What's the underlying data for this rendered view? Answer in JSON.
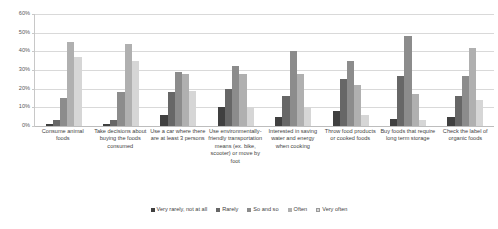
{
  "chart_data": {
    "type": "bar",
    "title": "",
    "xlabel": "",
    "ylabel": "",
    "ylim": [
      0,
      60
    ],
    "y_unit": "%",
    "grid": true,
    "legend_position": "bottom",
    "y_ticks": [
      "0%",
      "10%",
      "20%",
      "30%",
      "40%",
      "50%",
      "60%"
    ],
    "y_tick_values": [
      0,
      10,
      20,
      30,
      40,
      50,
      60
    ],
    "categories": [
      "Consume animal foods",
      "Take decisions about buying the foods consumed",
      "Use a car where there are at least 3 persons",
      "Use environmentally-friendly transportation means (ex. bike, scooter) or move by foot",
      "Interested in saving water and energy when cooking",
      "Throw food products or cooked foods",
      "Buy foods that require long term storage",
      "Check the label of organic foods"
    ],
    "series": [
      {
        "name": "Very rarely, not at all",
        "color": "#404040",
        "values": [
          1,
          1,
          6,
          10,
          5,
          8,
          4,
          5
        ]
      },
      {
        "name": "Rarely",
        "color": "#676767",
        "values": [
          3,
          3,
          18,
          20,
          16,
          25,
          27,
          16
        ]
      },
      {
        "name": "So and so",
        "color": "#8c8c8c",
        "values": [
          15,
          18,
          29,
          32,
          40,
          35,
          48,
          27
        ]
      },
      {
        "name": "Often",
        "color": "#b0b0b0",
        "values": [
          45,
          44,
          28,
          28,
          28,
          22,
          17,
          42
        ]
      },
      {
        "name": "Very often",
        "color": "#d6d6d6",
        "values": [
          37,
          35,
          19,
          10,
          10,
          6,
          3,
          14
        ]
      }
    ]
  }
}
